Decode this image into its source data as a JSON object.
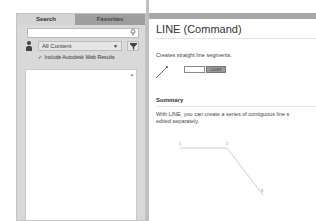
{
  "left_panel": {
    "tabs": [
      {
        "label": "Search",
        "active": true
      },
      {
        "label": "Favorites",
        "active": false
      }
    ],
    "search": {
      "value": "",
      "placeholder": ""
    },
    "content_filter": {
      "selected": "All Content"
    },
    "include_web_results": {
      "label": "Include Autodesk Web Results",
      "checked": true
    }
  },
  "main": {
    "title": "LINE (Command)",
    "description": "Creates straight line segments.",
    "command_button_label": "LLIST",
    "summary_heading": "Summary",
    "summary_lines": [
      "With LINE, you can create a series of contiguous line s",
      "edited separately."
    ],
    "diagram_points": [
      "1",
      "2",
      "3"
    ]
  }
}
